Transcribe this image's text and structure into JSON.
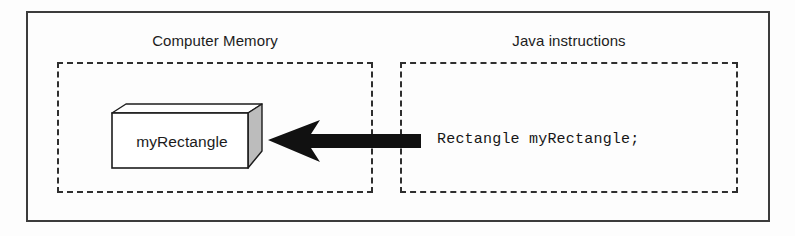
{
  "figure": {
    "background_color": "#fdfdfd",
    "frame_color": "#3c3c3c",
    "dash_color": "#2f2f2f",
    "ink_color": "#161616"
  },
  "panels": {
    "memory": {
      "caption": "Computer Memory"
    },
    "java": {
      "caption": "Java instructions"
    }
  },
  "variable_box": {
    "label": "myRectangle",
    "front_face_color": "#ffffff",
    "side_face_color": "#bcbcbc",
    "top_face_color": "#ffffff",
    "edge_color": "#1c1c1c"
  },
  "arrow": {
    "direction": "left",
    "color": "#111111",
    "name": "assignment-arrow"
  },
  "code": {
    "statement": "Rectangle myRectangle;"
  }
}
